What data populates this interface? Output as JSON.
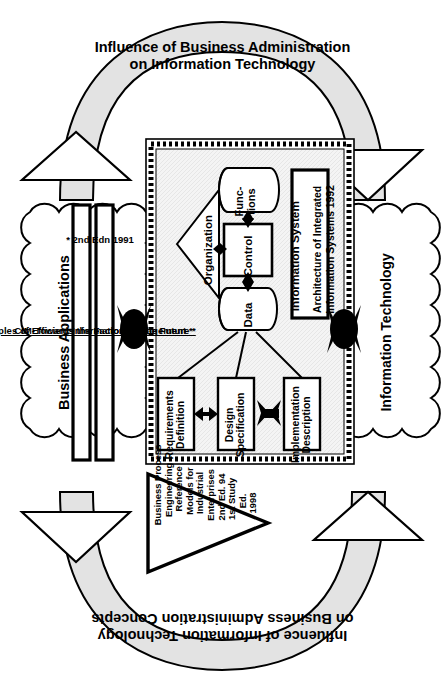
{
  "diagram": {
    "colors": {
      "arc_fill": "#e3e3e3",
      "arc_stroke": "#000000",
      "box_fill": "#f2f2f2",
      "white": "#ffffff",
      "black": "#000000"
    }
  },
  "arcs": {
    "top": {
      "line1": "Influence of Business Administration",
      "line2": "on Information Technology"
    },
    "bottom": {
      "line1": "Influence of Information Technology",
      "line2": "on Business Administration Concepts"
    }
  },
  "left_cloud": {
    "title": "Business Applications",
    "books": [
      "Principles of Efficient Information Management *",
      "CIM-Towards the Factory of the Future *"
    ],
    "footnote": "* 2nd Edn 1991"
  },
  "right_cloud": {
    "title": "Information Technology"
  },
  "center": {
    "system_label": "Information System",
    "reference": {
      "line1": "Architecture of Integrated",
      "line2": "Information Systems 1992"
    },
    "organization": "Organization",
    "functions": "Func-\ntions",
    "control": "Control",
    "data": "Data",
    "phases": [
      "Requirements\nDefinition",
      "Design\nSpecification",
      "Implementation\nDescription"
    ]
  },
  "bottom_triangle": {
    "lines": [
      "Business Process",
      "Engineering -",
      "Reference",
      "Models for",
      "Industrial",
      "Enterprises",
      "2nd Ed. 94",
      "1st Study",
      "Ed.",
      "1998"
    ],
    "text": "Business Process Engineering - Reference Models for Industrial Enterprises 2nd Ed. 94 1st Study Ed. 1998"
  },
  "icons": {
    "arrowhead_up": "arrowhead-up-icon",
    "arrowhead_down": "arrowhead-down-icon",
    "bowtie_arrow": "bidirectional-bowtie-arrow-icon",
    "cylinder": "cylinder-icon",
    "triangle": "triangle-icon"
  }
}
